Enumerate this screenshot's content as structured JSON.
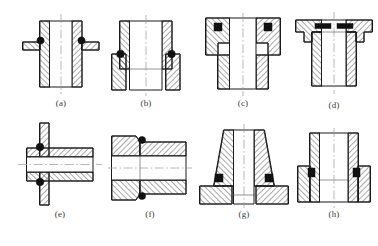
{
  "sheet": {
    "title": "O-ring seal groove configurations",
    "description": "Eight hatched cross-section engineering drawings (a)-(h) of cylindrical bores and flanged bosses, each showing black O-ring seals seated in grooves, with dash-dot centerlines.",
    "background_color": "#ffffff",
    "line_color": "#1a1a1a",
    "centerline_color": "#9a9a9a",
    "oring_color": "#111111",
    "rows": 2,
    "columns": 4
  },
  "figures": [
    {
      "id": "a",
      "caption": "(a)",
      "orientation": "vertical",
      "centerline": "vertical",
      "oring_count": 2,
      "oring_position": "outer-wall-top, on external flange shoulder",
      "description": "Straight-walled sleeve with a thin external flange plate near the top; round O-rings sit in the corner between sleeve wall and flange."
    },
    {
      "id": "b",
      "caption": "(b)",
      "orientation": "vertical",
      "centerline": "vertical",
      "oring_count": 2,
      "oring_position": "outer step shoulder, mid-height",
      "description": "Stepped sleeve, narrow above and wider below; O-rings seated at the outside step shoulder."
    },
    {
      "id": "c",
      "caption": "(c)",
      "orientation": "vertical",
      "centerline": "vertical",
      "oring_count": 2,
      "oring_position": "upper external groove, square section",
      "description": "Stepped boss with a narrow collar on top; square-section O-rings seated in grooves machined in the collar."
    },
    {
      "id": "d",
      "caption": "(d)",
      "orientation": "vertical",
      "centerline": "vertical",
      "oring_count": 2,
      "oring_position": "top face, flat rectangular gasket groove",
      "description": "Wide-flanged bush; flat rectangular seals lie in grooves on the upper end face under the flange lip."
    },
    {
      "id": "e",
      "caption": "(e)",
      "orientation": "horizontal",
      "centerline": "horizontal",
      "oring_count": 2,
      "oring_position": "against vertical bulkhead plate, left end",
      "description": "Horizontal tube passing through a vertical plate; O-rings compressed between tube shoulder and the plate face."
    },
    {
      "id": "f",
      "caption": "(f)",
      "orientation": "horizontal",
      "centerline": "horizontal",
      "oring_count": 2,
      "oring_position": "at step joint between two mating tubes",
      "description": "Two coaxial tubes butted at a stepped spigot joint; O-rings seated at the outer corner of the step."
    },
    {
      "id": "g",
      "caption": "(g)",
      "orientation": "vertical",
      "centerline": "vertical",
      "oring_count": 2,
      "oring_position": "base fillet between tapered wall and flange",
      "description": "Tapered conical boss rising from a wide base flange; square O-rings seated in grooves at the base corners."
    },
    {
      "id": "h",
      "caption": "(h)",
      "orientation": "vertical",
      "centerline": "vertical",
      "oring_count": 2,
      "oring_position": "internal bore step, lower half",
      "description": "Tube inserted into a wider socket; O-rings seated in the annular gap at the socket entry step."
    }
  ],
  "caption_labels": [
    "(a)",
    "(b)",
    "(c)",
    "(d)",
    "(e)",
    "(f)",
    "(g)",
    "(h)"
  ]
}
